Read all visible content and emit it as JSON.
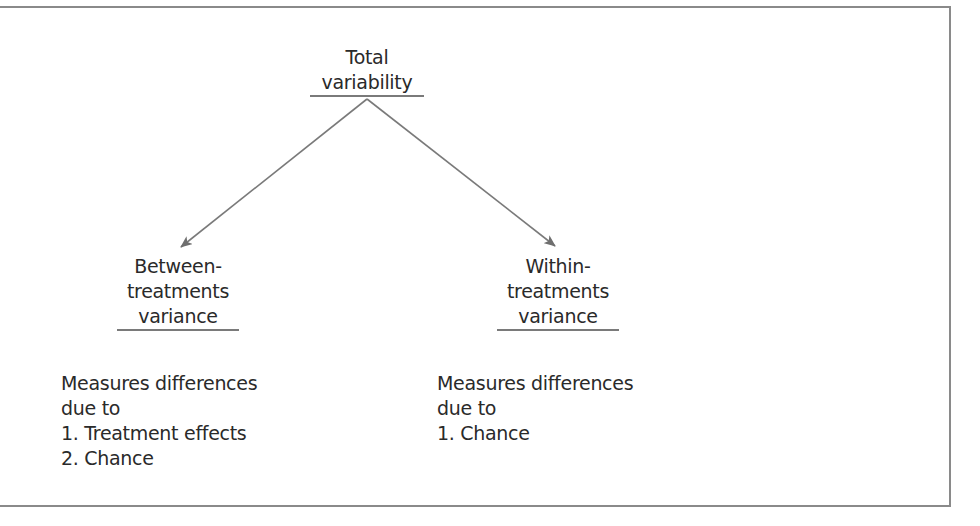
{
  "diagram": {
    "type": "tree",
    "root": {
      "lines": [
        "Total",
        "variability"
      ]
    },
    "branches": [
      {
        "id": "between",
        "lines": [
          "Between-",
          "treatments",
          "variance"
        ],
        "description": {
          "lines": [
            "Measures differences",
            "due to",
            "1. Treatment effects",
            "2. Chance"
          ]
        }
      },
      {
        "id": "within",
        "lines": [
          "Within-",
          "treatments",
          "variance"
        ],
        "description": {
          "lines": [
            "Measures differences",
            "due to",
            "1. Chance"
          ]
        }
      }
    ],
    "colors": {
      "text": "#2a2a2a",
      "lines": "#7a7a7a",
      "frame": "#8a8a8a"
    }
  }
}
